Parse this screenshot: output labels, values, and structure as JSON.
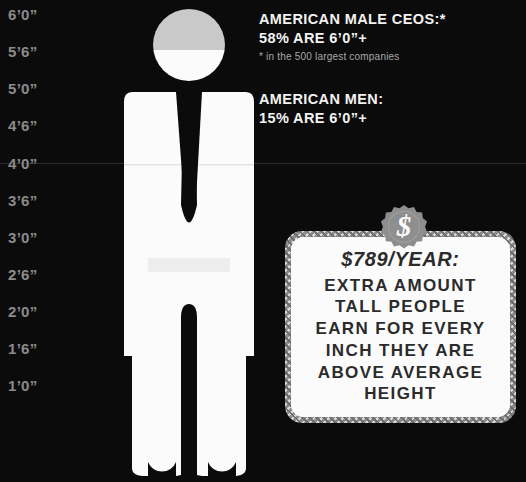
{
  "axis": {
    "name": "height-scale",
    "unit": "feet-inches",
    "ticks": [
      {
        "label": "6’0”",
        "y": 7
      },
      {
        "label": "5’6”",
        "y": 44
      },
      {
        "label": "5’0”",
        "y": 81
      },
      {
        "label": "4’6”",
        "y": 118
      },
      {
        "label": "4’0”",
        "y": 156
      },
      {
        "label": "3’6”",
        "y": 193
      },
      {
        "label": "3’0”",
        "y": 230
      },
      {
        "label": "2’6”",
        "y": 267
      },
      {
        "label": "2’0”",
        "y": 304
      },
      {
        "label": "1’6”",
        "y": 341
      },
      {
        "label": "1’0”",
        "y": 378
      }
    ],
    "gridline_y": 163
  },
  "stats": {
    "ceos": {
      "title": "AMERICAN MALE CEOS:*",
      "value": "58% ARE 6’0”+",
      "footnote": "* in the 500 largest companies"
    },
    "men": {
      "title": "AMERICAN MEN:",
      "value": "15% ARE 6’0”+"
    }
  },
  "money_box": {
    "badge_symbol": "$",
    "badge_name": "dollar-badge",
    "amount": "$789/YEAR:",
    "lines": [
      "EXTRA AMOUNT",
      "TALL PEOPLE",
      "EARN FOR EVERY",
      "INCH THEY ARE",
      "ABOVE AVERAGE",
      "HEIGHT"
    ]
  },
  "figure": {
    "name": "male-silhouette",
    "head_fill_top": "#c9c9c9",
    "head_fill_bottom": "#fbfbfb",
    "body_fill": "#fbfbfb",
    "shade_fill": "#e9e9e9"
  },
  "colors": {
    "background": "#0b0b0b",
    "axis_text": "#8b8b8b",
    "gridline": "#2b2b2b",
    "body_text": "#f2f2f2",
    "note_text": "#a8a8a8",
    "box_bg": "#fbfbfb",
    "box_text": "#2b2b2b",
    "badge": "#8e8e8e"
  }
}
